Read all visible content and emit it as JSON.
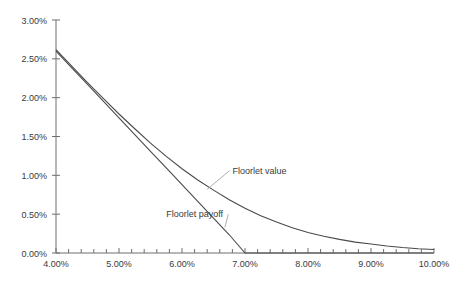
{
  "chart_data": {
    "type": "line",
    "title": "",
    "xlabel": "",
    "ylabel": "",
    "xlim": [
      4.0,
      10.0
    ],
    "ylim": [
      0.0,
      3.0
    ],
    "grid": false,
    "legend_position": "inline-annotations",
    "x_tick_labels": [
      "4.00%",
      "5.00%",
      "6.00%",
      "7.00%",
      "8.00%",
      "9.00%",
      "10.00%"
    ],
    "x_tick_values": [
      4.0,
      5.0,
      6.0,
      7.0,
      8.0,
      9.0,
      10.0
    ],
    "x_minor_step": 0.2,
    "y_tick_labels": [
      "0.00%",
      "0.50%",
      "1.00%",
      "1.50%",
      "2.00%",
      "2.50%",
      "3.00%"
    ],
    "y_tick_values": [
      0.0,
      0.5,
      1.0,
      1.5,
      2.0,
      2.5,
      3.0
    ],
    "x": [
      4.0,
      4.25,
      4.5,
      4.75,
      5.0,
      5.25,
      5.5,
      5.75,
      6.0,
      6.25,
      6.5,
      6.75,
      7.0,
      7.25,
      7.5,
      7.75,
      8.0,
      8.25,
      8.5,
      8.75,
      9.0,
      9.25,
      9.5,
      9.75,
      10.0
    ],
    "series": [
      {
        "name": "Floorlet payoff",
        "color": "#4a4a4a",
        "values": [
          2.6,
          2.385,
          2.17,
          1.955,
          1.74,
          1.525,
          1.31,
          1.095,
          0.88,
          0.665,
          0.45,
          0.235,
          0.0,
          0.0,
          0.0,
          0.0,
          0.0,
          0.0,
          0.0,
          0.0,
          0.0,
          0.0,
          0.0,
          0.0,
          0.0
        ],
        "annotation": {
          "label": "Floorlet payoff",
          "label_x": 5.75,
          "label_y": 0.46,
          "anchor_x": 6.68,
          "anchor_y": 0.33
        }
      },
      {
        "name": "Floorlet value",
        "color": "#4a4a4a",
        "values": [
          2.62,
          2.405,
          2.195,
          1.99,
          1.79,
          1.6,
          1.415,
          1.245,
          1.085,
          0.94,
          0.81,
          0.685,
          0.575,
          0.48,
          0.4,
          0.325,
          0.265,
          0.215,
          0.175,
          0.14,
          0.115,
          0.09,
          0.07,
          0.055,
          0.045
        ],
        "annotation": {
          "label": "Floorlet value",
          "label_x": 6.8,
          "label_y": 1.02,
          "anchor_x": 6.4,
          "anchor_y": 0.82
        }
      }
    ]
  },
  "colors": {
    "axis": "#6e6e6e",
    "text": "#3a3a3a",
    "line": "#4a4a4a",
    "leader": "#9a9a9a",
    "background": "#ffffff"
  }
}
